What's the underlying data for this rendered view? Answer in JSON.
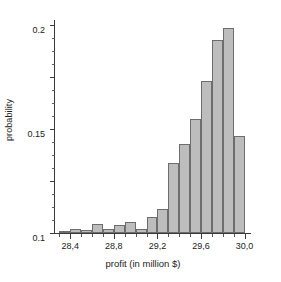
{
  "chart_data": {
    "type": "bar",
    "title": "",
    "subtitle": "",
    "xlabel": "profit (in million $)",
    "ylabel": "probability",
    "grid": false,
    "legend": null,
    "legend_position": "none",
    "bin_width": 0.1,
    "xlim": [
      28.25,
      30.05
    ],
    "ylim": [
      0,
      0.205
    ],
    "x_tick_labels": [
      "28,4",
      "28,8",
      "29,2",
      "29,6",
      "30,0"
    ],
    "x_tick_values": [
      28.4,
      28.8,
      29.2,
      29.6,
      30.0
    ],
    "x_minor_tick_step": 0.1,
    "y_tick_labels": [
      "0",
      "0.05",
      "0.1",
      "0.15",
      "0.2"
    ],
    "y_tick_values": [
      0,
      0.05,
      0.1,
      0.15,
      0.2
    ],
    "y_minor_tick_step": 0.0125,
    "decimal_separator_x": ",",
    "decimal_separator_y": ".",
    "bar_fill_color": "#bdbdbd",
    "bar_edge_color": "#6d6d6d",
    "axis_color": "#3a3a3a",
    "background_color": "#ffffff",
    "categories": [
      28.35,
      28.45,
      28.55,
      28.65,
      28.75,
      28.85,
      28.95,
      29.05,
      29.15,
      29.25,
      29.35,
      29.45,
      29.55,
      29.65,
      29.75,
      29.85,
      29.95
    ],
    "bin_left_edges": [
      28.3,
      28.4,
      28.5,
      28.6,
      28.7,
      28.8,
      28.9,
      29.0,
      29.1,
      29.2,
      29.3,
      29.4,
      29.5,
      29.6,
      29.7,
      29.8,
      29.9
    ],
    "values": [
      0.002,
      0.004,
      0.003,
      0.009,
      0.004,
      0.008,
      0.011,
      0.004,
      0.015,
      0.023,
      0.067,
      0.086,
      0.11,
      0.146,
      0.186,
      0.197,
      0.093
    ],
    "extra_tail_bin_left_edge": 30.0,
    "series": [
      {
        "name": "probability",
        "values": [
          0.002,
          0.004,
          0.003,
          0.009,
          0.004,
          0.008,
          0.011,
          0.004,
          0.015,
          0.023,
          0.067,
          0.086,
          0.11,
          0.146,
          0.186,
          0.197,
          0.093
        ]
      }
    ],
    "peak_value": 0.197,
    "peak_bin": 29.85
  }
}
